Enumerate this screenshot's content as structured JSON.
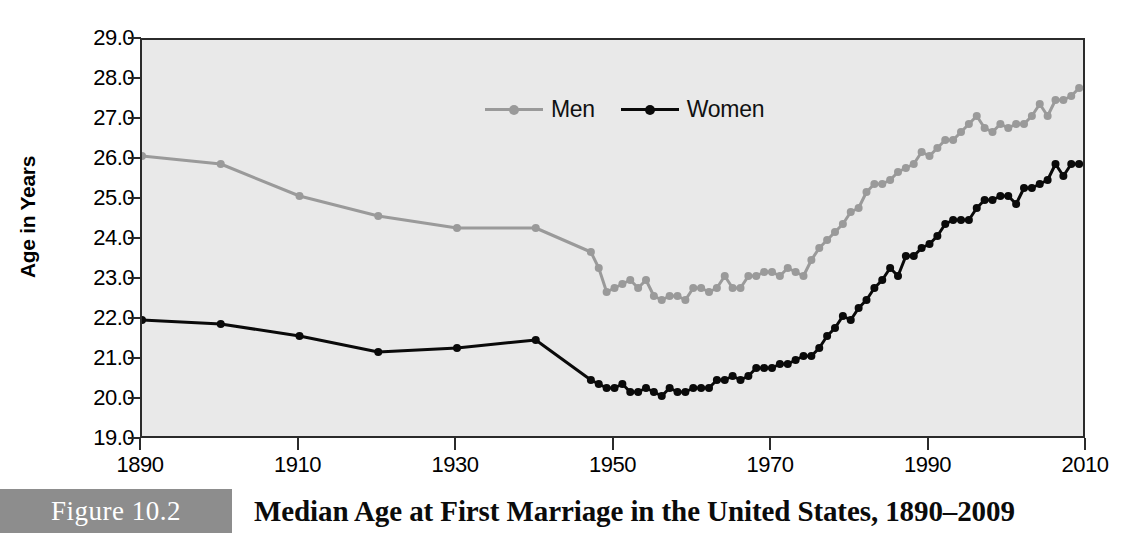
{
  "figure": {
    "badge_label": "Figure 10.2",
    "caption": "Median Age at First Marriage in the United States, 1890–2009"
  },
  "legend": {
    "position": "top-center-inside",
    "entries": [
      {
        "label": "Men",
        "color": "#9a9a9a"
      },
      {
        "label": "Women",
        "color": "#0a0a0a"
      }
    ]
  },
  "axes": {
    "y_title": "Age in Years",
    "y_tick_labels": [
      "29.0",
      "28.0",
      "27.0",
      "26.0",
      "25.0",
      "24.0",
      "23.0",
      "22.0",
      "21.0",
      "20.0",
      "19.0"
    ],
    "x_tick_labels": [
      "1890",
      "1910",
      "1930",
      "1950",
      "1970",
      "1990",
      "2010"
    ]
  },
  "colors": {
    "men_line": "#9a9a9a",
    "women_line": "#0a0a0a",
    "plot_background": "#e9e9e9",
    "frame": "#2b2b2b",
    "badge": "#8d8d8d",
    "text": "#000000"
  },
  "chart_data": {
    "type": "line",
    "title": "Median Age at First Marriage in the United States, 1890–2009",
    "xlabel": "",
    "ylabel": "Age in Years",
    "xlim": [
      1890,
      2010
    ],
    "ylim": [
      19.0,
      29.0
    ],
    "y_ticks": [
      19.0,
      20.0,
      21.0,
      22.0,
      23.0,
      24.0,
      25.0,
      26.0,
      27.0,
      28.0,
      29.0
    ],
    "x_ticks": [
      1890,
      1910,
      1930,
      1950,
      1970,
      1990,
      2010
    ],
    "grid": false,
    "legend_position": "top center",
    "markers": true,
    "series": [
      {
        "name": "Men",
        "color": "#9a9a9a",
        "points": [
          [
            1890,
            26.1
          ],
          [
            1900,
            25.9
          ],
          [
            1910,
            25.1
          ],
          [
            1920,
            24.6
          ],
          [
            1930,
            24.3
          ],
          [
            1940,
            24.3
          ],
          [
            1947,
            23.7
          ],
          [
            1948,
            23.3
          ],
          [
            1949,
            22.7
          ],
          [
            1950,
            22.8
          ],
          [
            1951,
            22.9
          ],
          [
            1952,
            23.0
          ],
          [
            1953,
            22.8
          ],
          [
            1954,
            23.0
          ],
          [
            1955,
            22.6
          ],
          [
            1956,
            22.5
          ],
          [
            1957,
            22.6
          ],
          [
            1958,
            22.6
          ],
          [
            1959,
            22.5
          ],
          [
            1960,
            22.8
          ],
          [
            1961,
            22.8
          ],
          [
            1962,
            22.7
          ],
          [
            1963,
            22.8
          ],
          [
            1964,
            23.1
          ],
          [
            1965,
            22.8
          ],
          [
            1966,
            22.8
          ],
          [
            1967,
            23.1
          ],
          [
            1968,
            23.1
          ],
          [
            1969,
            23.2
          ],
          [
            1970,
            23.2
          ],
          [
            1971,
            23.1
          ],
          [
            1972,
            23.3
          ],
          [
            1973,
            23.2
          ],
          [
            1974,
            23.1
          ],
          [
            1975,
            23.5
          ],
          [
            1976,
            23.8
          ],
          [
            1977,
            24.0
          ],
          [
            1978,
            24.2
          ],
          [
            1979,
            24.4
          ],
          [
            1980,
            24.7
          ],
          [
            1981,
            24.8
          ],
          [
            1982,
            25.2
          ],
          [
            1983,
            25.4
          ],
          [
            1984,
            25.4
          ],
          [
            1985,
            25.5
          ],
          [
            1986,
            25.7
          ],
          [
            1987,
            25.8
          ],
          [
            1988,
            25.9
          ],
          [
            1989,
            26.2
          ],
          [
            1990,
            26.1
          ],
          [
            1991,
            26.3
          ],
          [
            1992,
            26.5
          ],
          [
            1993,
            26.5
          ],
          [
            1994,
            26.7
          ],
          [
            1995,
            26.9
          ],
          [
            1996,
            27.1
          ],
          [
            1997,
            26.8
          ],
          [
            1998,
            26.7
          ],
          [
            1999,
            26.9
          ],
          [
            2000,
            26.8
          ],
          [
            2001,
            26.9
          ],
          [
            2002,
            26.9
          ],
          [
            2003,
            27.1
          ],
          [
            2004,
            27.4
          ],
          [
            2005,
            27.1
          ],
          [
            2006,
            27.5
          ],
          [
            2007,
            27.5
          ],
          [
            2008,
            27.6
          ],
          [
            2009,
            27.8
          ]
        ]
      },
      {
        "name": "Women",
        "color": "#0a0a0a",
        "points": [
          [
            1890,
            22.0
          ],
          [
            1900,
            21.9
          ],
          [
            1910,
            21.6
          ],
          [
            1920,
            21.2
          ],
          [
            1930,
            21.3
          ],
          [
            1940,
            21.5
          ],
          [
            1947,
            20.5
          ],
          [
            1948,
            20.4
          ],
          [
            1949,
            20.3
          ],
          [
            1950,
            20.3
          ],
          [
            1951,
            20.4
          ],
          [
            1952,
            20.2
          ],
          [
            1953,
            20.2
          ],
          [
            1954,
            20.3
          ],
          [
            1955,
            20.2
          ],
          [
            1956,
            20.1
          ],
          [
            1957,
            20.3
          ],
          [
            1958,
            20.2
          ],
          [
            1959,
            20.2
          ],
          [
            1960,
            20.3
          ],
          [
            1961,
            20.3
          ],
          [
            1962,
            20.3
          ],
          [
            1963,
            20.5
          ],
          [
            1964,
            20.5
          ],
          [
            1965,
            20.6
          ],
          [
            1966,
            20.5
          ],
          [
            1967,
            20.6
          ],
          [
            1968,
            20.8
          ],
          [
            1969,
            20.8
          ],
          [
            1970,
            20.8
          ],
          [
            1971,
            20.9
          ],
          [
            1972,
            20.9
          ],
          [
            1973,
            21.0
          ],
          [
            1974,
            21.1
          ],
          [
            1975,
            21.1
          ],
          [
            1976,
            21.3
          ],
          [
            1977,
            21.6
          ],
          [
            1978,
            21.8
          ],
          [
            1979,
            22.1
          ],
          [
            1980,
            22.0
          ],
          [
            1981,
            22.3
          ],
          [
            1982,
            22.5
          ],
          [
            1983,
            22.8
          ],
          [
            1984,
            23.0
          ],
          [
            1985,
            23.3
          ],
          [
            1986,
            23.1
          ],
          [
            1987,
            23.6
          ],
          [
            1988,
            23.6
          ],
          [
            1989,
            23.8
          ],
          [
            1990,
            23.9
          ],
          [
            1991,
            24.1
          ],
          [
            1992,
            24.4
          ],
          [
            1993,
            24.5
          ],
          [
            1994,
            24.5
          ],
          [
            1995,
            24.5
          ],
          [
            1996,
            24.8
          ],
          [
            1997,
            25.0
          ],
          [
            1998,
            25.0
          ],
          [
            1999,
            25.1
          ],
          [
            2000,
            25.1
          ],
          [
            2001,
            24.9
          ],
          [
            2002,
            25.3
          ],
          [
            2003,
            25.3
          ],
          [
            2004,
            25.4
          ],
          [
            2005,
            25.5
          ],
          [
            2006,
            25.9
          ],
          [
            2007,
            25.6
          ],
          [
            2008,
            25.9
          ],
          [
            2009,
            25.9
          ]
        ]
      }
    ]
  }
}
